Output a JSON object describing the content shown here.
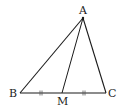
{
  "diagram": {
    "type": "triangle-with-median",
    "stroke_color": "#1a1a1a",
    "points": {
      "A": {
        "label": "A",
        "x": 83,
        "y": 18
      },
      "B": {
        "label": "B",
        "x": 20,
        "y": 93
      },
      "C": {
        "label": "C",
        "x": 106,
        "y": 93
      },
      "M": {
        "label": "M",
        "x": 62,
        "y": 93
      }
    },
    "segments": [
      "AB",
      "AC",
      "BC",
      "AM"
    ],
    "equal_marks": {
      "style": "double-tick",
      "segments": [
        "BM",
        "MC"
      ]
    }
  }
}
